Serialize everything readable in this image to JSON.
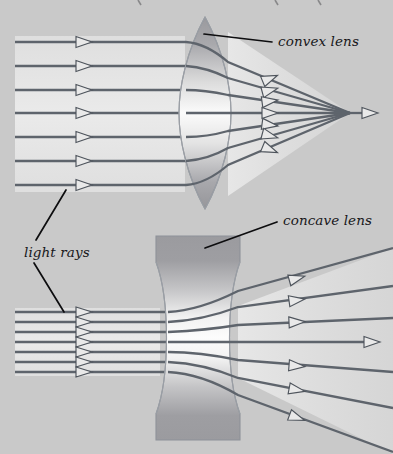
{
  "figure": {
    "background_color": "#c9c9c9",
    "ray_color": "#5e646c",
    "leader_color": "#0d0d0f",
    "lens_outline_color": "#8e9299",
    "arrow_fill_color": "#e9e9e9"
  },
  "labels": {
    "convex_lens": "convex lens",
    "concave_lens": "concave lens",
    "light_rays": "light rays"
  },
  "diagrams": {
    "convex": {
      "name": "convex-lens-diagram",
      "lens_type": "biconvex",
      "behaviour": "converging",
      "ray_count": 7,
      "incoming_ray_y": [
        42,
        66,
        90,
        113,
        137,
        161,
        185
      ],
      "incoming_ray_x_start": 15,
      "incoming_arrow_x": 85,
      "lens_left_x": 182,
      "lens_right_x": 228,
      "lens_top_y": 18,
      "lens_bottom_y": 208,
      "focal_point_x": 350,
      "focal_point_y": 113,
      "exit_arrow_x": 268,
      "focal_arrow_x": 372
    },
    "concave": {
      "name": "concave-lens-diagram",
      "lens_type": "biconcave",
      "behaviour": "diverging",
      "ray_count": 7,
      "incoming_ray_y": [
        312,
        322,
        332,
        342,
        352,
        362,
        372
      ],
      "incoming_ray_x_start": 15,
      "incoming_arrow_x": 85,
      "lens_left_x": 154,
      "lens_right_x": 242,
      "lens_top_y": 236,
      "lens_bottom_y": 440,
      "lens_waist_half_width": 14,
      "exit_arrow_x": 295,
      "center_arrow_x": 375,
      "divergence_spread_y": [
        255,
        293,
        325,
        342,
        378,
        410,
        448
      ]
    }
  }
}
